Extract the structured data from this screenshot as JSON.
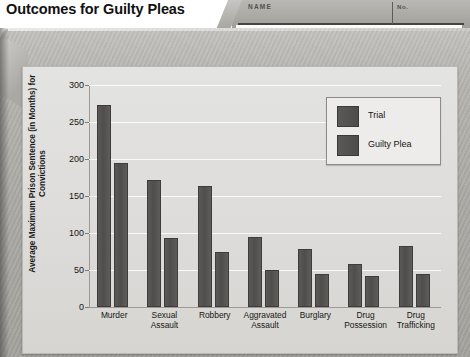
{
  "page": {
    "title": "Outcomes for Guilty Pleas"
  },
  "folder_tab": {
    "name_label": "NAME",
    "no_label": "No."
  },
  "chart_data": {
    "type": "bar",
    "title": "Outcomes for Guilty Pleas",
    "xlabel": "",
    "ylabel": "Average Maximum Prison Sentence (in Months) for Convictions",
    "ylim": [
      0,
      300
    ],
    "yticks": [
      0,
      50,
      100,
      150,
      200,
      250,
      300
    ],
    "ytick_labels": [
      "0",
      "50",
      "100",
      "150",
      "200",
      "250",
      "300"
    ],
    "grid": true,
    "legend_position": "top-right",
    "categories": [
      "Murder",
      "Sexual Assault",
      "Robbery",
      "Aggravated Assault",
      "Burglary",
      "Drug Possession",
      "Drug Trafficking"
    ],
    "category_lines": [
      [
        "Murder"
      ],
      [
        "Sexual",
        "Assault"
      ],
      [
        "Robbery"
      ],
      [
        "Aggravated",
        "Assault"
      ],
      [
        "Burglary"
      ],
      [
        "Drug",
        "Possession"
      ],
      [
        "Drug",
        "Trafficking"
      ]
    ],
    "series": [
      {
        "name": "Trial",
        "color": "#514f4d",
        "values": [
          273,
          172,
          163,
          95,
          79,
          58,
          82
        ]
      },
      {
        "name": "Guilty Plea",
        "color": "#514f4d",
        "values": [
          195,
          93,
          75,
          50,
          44,
          42,
          45
        ]
      }
    ]
  },
  "colors": {
    "bar": "#514f4d",
    "panel": "#dedddb",
    "folder": "#aaa9a4",
    "gridline": "#ffffff"
  }
}
